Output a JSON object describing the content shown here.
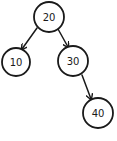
{
  "diagram": {
    "type": "binary-search-tree",
    "style": "hand-drawn",
    "colors": {
      "background": "#ffffff",
      "stroke": "#1a1a1a",
      "text": "#1a1a1a"
    },
    "nodes": [
      {
        "id": "n20",
        "label": "20",
        "cx": 49,
        "cy": 17,
        "r": 15
      },
      {
        "id": "n10",
        "label": "10",
        "cx": 16,
        "cy": 62,
        "r": 14
      },
      {
        "id": "n30",
        "label": "30",
        "cx": 73,
        "cy": 61,
        "r": 15
      },
      {
        "id": "n40",
        "label": "40",
        "cx": 98,
        "cy": 113,
        "r": 15
      }
    ],
    "edges": [
      {
        "from": "20",
        "to": "10",
        "x1": 37,
        "y1": 28,
        "x2": 22,
        "y2": 49
      },
      {
        "from": "20",
        "to": "30",
        "x1": 58,
        "y1": 29,
        "x2": 68,
        "y2": 47
      },
      {
        "from": "30",
        "to": "40",
        "x1": 82,
        "y1": 75,
        "x2": 91,
        "y2": 99
      }
    ]
  }
}
